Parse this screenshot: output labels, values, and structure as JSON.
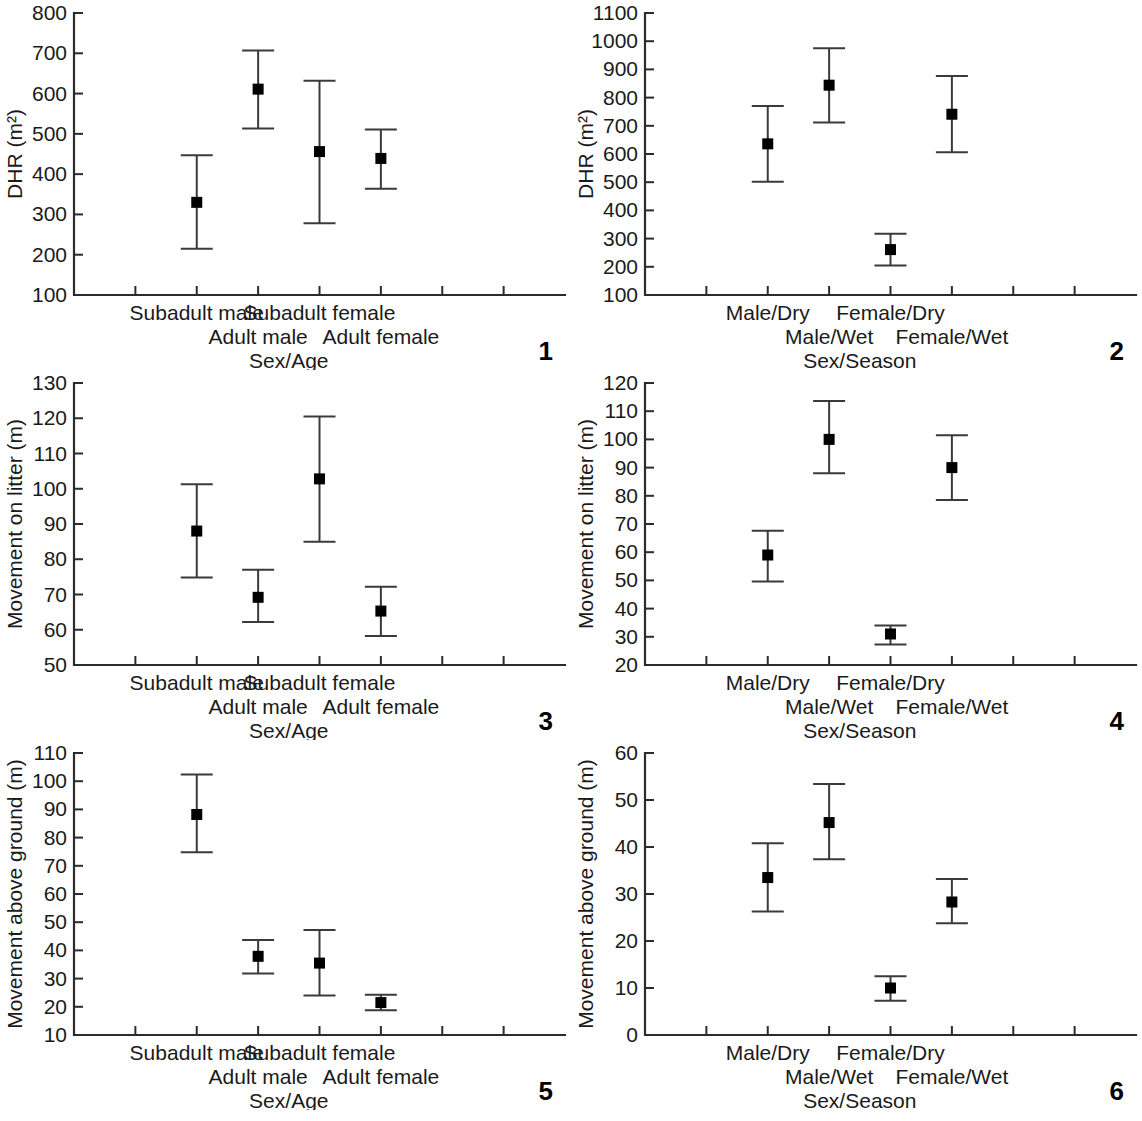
{
  "figure": {
    "panel_count": 6,
    "marker_color": "#000000",
    "axis_color": "#2b2b2b",
    "error_color": "#3a3a3a"
  },
  "panels": [
    {
      "number": "1",
      "ylabel": "DHR (m²)",
      "xlabel": "Sex/Age",
      "yticks": [
        "100",
        "200",
        "300",
        "400",
        "500",
        "600",
        "700",
        "800"
      ],
      "categories": [
        "Subadult male",
        "Adult male",
        "Subadult female",
        "Adult female"
      ]
    },
    {
      "number": "2",
      "ylabel": "DHR (m²)",
      "xlabel": "Sex/Season",
      "yticks": [
        "100",
        "200",
        "300",
        "400",
        "500",
        "600",
        "700",
        "800",
        "900",
        "1000",
        "1100"
      ],
      "categories": [
        "Male/Dry",
        "Male/Wet",
        "Female/Dry",
        "Female/Wet"
      ]
    },
    {
      "number": "3",
      "ylabel": "Movement on litter (m)",
      "xlabel": "Sex/Age",
      "yticks": [
        "50",
        "60",
        "70",
        "80",
        "90",
        "100",
        "110",
        "120",
        "130"
      ],
      "categories": [
        "Subadult male",
        "Adult male",
        "Subadult female",
        "Adult female"
      ]
    },
    {
      "number": "4",
      "ylabel": "Movement on litter (m)",
      "xlabel": "Sex/Season",
      "yticks": [
        "20",
        "30",
        "40",
        "50",
        "60",
        "70",
        "80",
        "90",
        "100",
        "110",
        "120"
      ],
      "categories": [
        "Male/Dry",
        "Male/Wet",
        "Female/Dry",
        "Female/Wet"
      ]
    },
    {
      "number": "5",
      "ylabel": "Movement above ground (m)",
      "xlabel": "Sex/Age",
      "yticks": [
        "10",
        "20",
        "30",
        "40",
        "50",
        "60",
        "70",
        "80",
        "90",
        "100",
        "110"
      ],
      "categories": [
        "Subadult male",
        "Adult male",
        "Subadult female",
        "Adult female"
      ]
    },
    {
      "number": "6",
      "ylabel": "Movement above ground (m)",
      "xlabel": "Sex/Season",
      "yticks": [
        "0",
        "10",
        "20",
        "30",
        "40",
        "50",
        "60"
      ],
      "categories": [
        "Male/Dry",
        "Male/Wet",
        "Female/Dry",
        "Female/Wet"
      ]
    }
  ],
  "chart_data": [
    {
      "type": "scatter",
      "panel": "1",
      "title": "",
      "xlabel": "Sex/Age",
      "ylabel": "DHR (m²)",
      "ylim": [
        100,
        800
      ],
      "ytick_step": 100,
      "grid": false,
      "legend": "none",
      "categories": [
        "Subadult male",
        "Adult male",
        "Subadult female",
        "Adult female"
      ],
      "values": [
        330,
        611,
        456,
        439
      ],
      "error_low": [
        215,
        513,
        278,
        364
      ],
      "error_high": [
        447,
        707,
        632,
        511
      ]
    },
    {
      "type": "scatter",
      "panel": "2",
      "title": "",
      "xlabel": "Sex/Season",
      "ylabel": "DHR (m²)",
      "ylim": [
        100,
        1100
      ],
      "ytick_step": 100,
      "grid": false,
      "legend": "none",
      "categories": [
        "Male/Dry",
        "Male/Wet",
        "Female/Dry",
        "Female/Wet"
      ],
      "values": [
        636,
        844,
        261,
        741
      ],
      "error_low": [
        502,
        712,
        205,
        606
      ],
      "error_high": [
        770,
        975,
        317,
        877
      ]
    },
    {
      "type": "scatter",
      "panel": "3",
      "title": "",
      "xlabel": "Sex/Age",
      "ylabel": "Movement on litter (m)",
      "ylim": [
        50,
        130
      ],
      "ytick_step": 10,
      "grid": false,
      "legend": "none",
      "categories": [
        "Subadult male",
        "Adult male",
        "Subadult female",
        "Adult female"
      ],
      "values": [
        88,
        69.2,
        102.8,
        65.3
      ],
      "error_low": [
        74.8,
        62.2,
        85,
        58.2
      ],
      "error_high": [
        101.3,
        77,
        120.5,
        72.2
      ]
    },
    {
      "type": "scatter",
      "panel": "4",
      "title": "",
      "xlabel": "Sex/Season",
      "ylabel": "Movement on litter (m)",
      "ylim": [
        20,
        120
      ],
      "ytick_step": 10,
      "grid": false,
      "legend": "none",
      "categories": [
        "Male/Dry",
        "Male/Wet",
        "Female/Dry",
        "Female/Wet"
      ],
      "values": [
        59,
        100,
        31,
        90
      ],
      "error_low": [
        49.6,
        88,
        27.3,
        78.5
      ],
      "error_high": [
        67.6,
        113.6,
        34,
        101.5
      ]
    },
    {
      "type": "scatter",
      "panel": "5",
      "title": "",
      "xlabel": "Sex/Age",
      "ylabel": "Movement above ground (m)",
      "ylim": [
        10,
        110
      ],
      "ytick_step": 10,
      "grid": false,
      "legend": "none",
      "categories": [
        "Subadult male",
        "Adult male",
        "Subadult female",
        "Adult female"
      ],
      "values": [
        88.2,
        37.9,
        35.5,
        21.5
      ],
      "error_low": [
        74.8,
        31.8,
        24,
        18.8
      ],
      "error_high": [
        102.4,
        43.7,
        47.2,
        24.3
      ]
    },
    {
      "type": "scatter",
      "panel": "6",
      "title": "",
      "xlabel": "Sex/Season",
      "ylabel": "Movement above ground (m)",
      "ylim": [
        0,
        60
      ],
      "ytick_step": 10,
      "grid": false,
      "legend": "none",
      "categories": [
        "Male/Dry",
        "Male/Wet",
        "Female/Dry",
        "Female/Wet"
      ],
      "values": [
        33.5,
        45.2,
        10,
        28.3
      ],
      "error_low": [
        26.3,
        37.4,
        7.3,
        23.8
      ],
      "error_high": [
        40.8,
        53.4,
        12.5,
        33.2
      ]
    }
  ]
}
